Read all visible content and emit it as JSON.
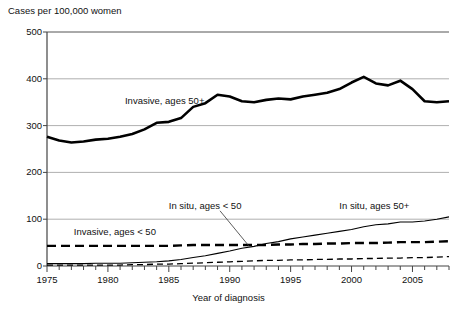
{
  "chart_data": {
    "type": "line",
    "title": "Cases per 100,000 women",
    "xlabel": "Year of diagnosis",
    "ylabel": "Cases per 100,000 women",
    "xlim": [
      1975,
      2008
    ],
    "ylim": [
      0,
      500
    ],
    "xticks": [
      "1975",
      "1980",
      "1985",
      "1990",
      "1995",
      "2000",
      "2005"
    ],
    "xtick_values": [
      1975,
      1980,
      1985,
      1990,
      1995,
      2000,
      2005
    ],
    "yticks": [
      "0",
      "100",
      "200",
      "300",
      "400",
      "500"
    ],
    "ytick_values": [
      0,
      100,
      200,
      300,
      400,
      500
    ],
    "grid": "horizontal",
    "legend_position": "inline-annotations",
    "x": [
      1975,
      1976,
      1977,
      1978,
      1979,
      1980,
      1981,
      1982,
      1983,
      1984,
      1985,
      1986,
      1987,
      1988,
      1989,
      1990,
      1991,
      1992,
      1993,
      1994,
      1995,
      1996,
      1997,
      1998,
      1999,
      2000,
      2001,
      2002,
      2003,
      2004,
      2005,
      2006,
      2007,
      2008
    ],
    "series": [
      {
        "name": "Invasive, ages 50+",
        "style": "solid-thick",
        "color": "#000000",
        "label_x": 1981.4,
        "label_y": 352,
        "values": [
          276,
          268,
          264,
          266,
          270,
          272,
          276,
          282,
          292,
          306,
          308,
          316,
          340,
          348,
          366,
          362,
          352,
          350,
          355,
          358,
          356,
          362,
          366,
          370,
          378,
          392,
          404,
          390,
          386,
          396,
          378,
          352,
          350,
          352
        ]
      },
      {
        "name": "Invasive, ages < 50",
        "style": "dashed",
        "color": "#000000",
        "label_x": 1977.2,
        "label_y": 72,
        "values": [
          43,
          43,
          43,
          43,
          43,
          43,
          43,
          43,
          43,
          43,
          43,
          44,
          45,
          45,
          45,
          45,
          45,
          45,
          45,
          46,
          46,
          47,
          47,
          48,
          48,
          49,
          49,
          49,
          50,
          51,
          51,
          51,
          52,
          53
        ]
      },
      {
        "name": "In situ, ages 50+",
        "style": "solid-thin",
        "color": "#000000",
        "label_x": 1999.0,
        "label_y": 128,
        "values": [
          5,
          5,
          5,
          5,
          6,
          6,
          6,
          7,
          8,
          9,
          11,
          14,
          18,
          22,
          27,
          32,
          38,
          42,
          48,
          52,
          58,
          62,
          66,
          70,
          74,
          78,
          84,
          88,
          90,
          94,
          94,
          96,
          100,
          105
        ]
      },
      {
        "name": "In situ, ages < 50",
        "style": "dotted-dashed",
        "color": "#000000",
        "label_x": 1985.0,
        "label_y": 128,
        "leader_from": [
          1989.2,
          118
        ],
        "leader_to": [
          1991.6,
          42
        ],
        "values": [
          2,
          2,
          2,
          2,
          2,
          2,
          2,
          3,
          3,
          4,
          4,
          5,
          6,
          7,
          8,
          9,
          10,
          11,
          12,
          12,
          13,
          13,
          14,
          14,
          15,
          15,
          16,
          16,
          17,
          17,
          18,
          18,
          19,
          20
        ]
      }
    ]
  }
}
